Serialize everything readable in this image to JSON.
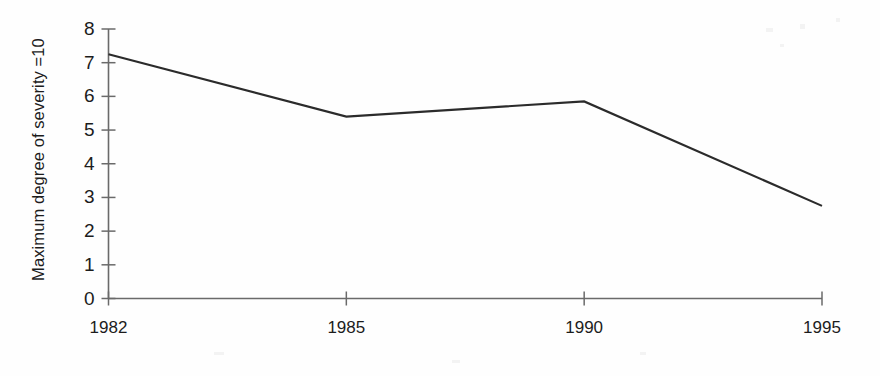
{
  "chart_data": {
    "type": "line",
    "title": "",
    "subtitle": "",
    "xlabel": "",
    "ylabel": "Maximum degree of severity =10",
    "categories": [
      "1982",
      "1985",
      "1990",
      "1995"
    ],
    "values": [
      7.25,
      5.4,
      5.85,
      2.75
    ],
    "series": [
      {
        "name": "Maximum degree of severity",
        "values": [
          7.25,
          5.4,
          5.85,
          2.75
        ]
      }
    ],
    "ylim": [
      0,
      8
    ],
    "y_ticks": [
      "0",
      "1",
      "2",
      "3",
      "4",
      "5",
      "6",
      "7",
      "8"
    ],
    "x_ticks": [
      "1982",
      "1985",
      "1990",
      "1995"
    ],
    "grid": false,
    "legend": false,
    "legend_position": "none",
    "line_color": "#2b2b2b",
    "axis_color": "#555555",
    "background_color": "#fefefe",
    "markers": false,
    "annotations": []
  },
  "axes": {
    "y_title": "Maximum degree of severity =10",
    "y_tick_labels": [
      "8",
      "7",
      "6",
      "5",
      "4",
      "3",
      "2",
      "1",
      "0"
    ],
    "x_tick_labels": [
      "1982",
      "1985",
      "1990",
      "1995"
    ]
  }
}
